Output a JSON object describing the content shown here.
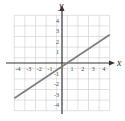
{
  "chart_data": {
    "type": "line",
    "title": "",
    "xlabel": "x",
    "ylabel": "y",
    "xlim": [
      -4.5,
      4.5
    ],
    "ylim": [
      -4.5,
      4.5
    ],
    "grid": true,
    "x_ticks": [
      "-4",
      "-3",
      "-2",
      "-1",
      "1",
      "2",
      "3",
      "4"
    ],
    "y_ticks": [
      "4",
      "3",
      "2",
      "1",
      "-1",
      "-2",
      "-3",
      "-4"
    ],
    "series": [
      {
        "name": "line",
        "x": [
          -4.5,
          4.5
        ],
        "y": [
          -3.33,
          2.67
        ],
        "color": "#808080"
      }
    ]
  },
  "labels": {
    "x_axis": "x",
    "y_axis": "y"
  }
}
